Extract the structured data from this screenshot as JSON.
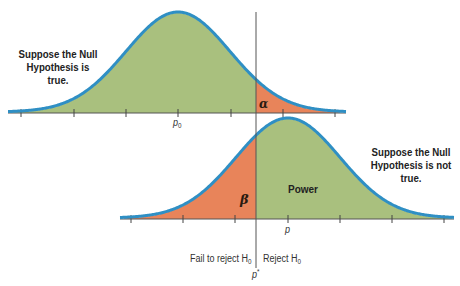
{
  "colors": {
    "accept_fill": "#a9c07e",
    "reject_fill": "#e8845a",
    "curve_stroke": "#2f8fc4",
    "axis": "#555555",
    "critical_line": "#555555"
  },
  "null_distribution": {
    "caption_line1": "Suppose the Null",
    "caption_line2": "Hypothesis is true.",
    "mean_label": "p",
    "mean_subscript": "0",
    "tail_label": "α"
  },
  "alt_distribution": {
    "caption_line1": "Suppose the Null",
    "caption_line2": "Hypothesis is not true.",
    "mean_label": "p",
    "left_region_label": "β",
    "right_region_label": "Power"
  },
  "decision": {
    "fail_label": "Fail to reject H",
    "fail_subscript": "0",
    "reject_label": "Reject H",
    "reject_subscript": "0",
    "critical_label": "p",
    "critical_superscript": "*"
  }
}
